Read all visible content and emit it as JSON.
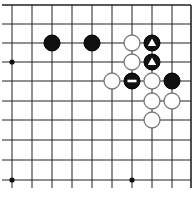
{
  "board": {
    "grid_x": [
      12,
      32,
      52,
      72,
      92,
      112,
      132,
      152,
      172,
      191
    ],
    "grid_y": [
      5,
      24,
      43,
      62,
      81,
      101,
      120,
      140,
      160,
      180
    ],
    "line_color": "#222222",
    "edges": {
      "top": true,
      "right": true,
      "left": false,
      "bottom": false
    },
    "star_points": [
      {
        "col": 0,
        "row": 3
      },
      {
        "col": 0,
        "row": 9
      },
      {
        "col": 6,
        "row": 9
      }
    ],
    "stones": [
      {
        "col": 2,
        "row": 2,
        "color": "black",
        "mark": ""
      },
      {
        "col": 4,
        "row": 2,
        "color": "black",
        "mark": ""
      },
      {
        "col": 6,
        "row": 2,
        "color": "white",
        "mark": ""
      },
      {
        "col": 7,
        "row": 2,
        "color": "black",
        "mark": "triangle"
      },
      {
        "col": 6,
        "row": 3,
        "color": "white",
        "mark": ""
      },
      {
        "col": 7,
        "row": 3,
        "color": "black",
        "mark": "triangle"
      },
      {
        "col": 5,
        "row": 4,
        "color": "white",
        "mark": ""
      },
      {
        "col": 6,
        "row": 4,
        "color": "black",
        "mark": "minus"
      },
      {
        "col": 7,
        "row": 4,
        "color": "white",
        "mark": ""
      },
      {
        "col": 8,
        "row": 4,
        "color": "black",
        "mark": ""
      },
      {
        "col": 7,
        "row": 5,
        "color": "white",
        "mark": ""
      },
      {
        "col": 8,
        "row": 5,
        "color": "white",
        "mark": ""
      },
      {
        "col": 7,
        "row": 6,
        "color": "white",
        "mark": ""
      }
    ]
  }
}
